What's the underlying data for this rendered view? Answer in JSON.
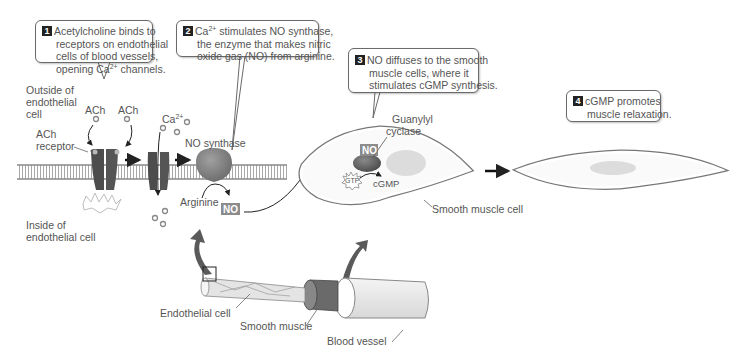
{
  "callouts": [
    {
      "number": "1",
      "lines": [
        "Acetylcholine binds to",
        "receptors on endothelial",
        "cells of blood vessels,",
        "opening Ca2+ channels."
      ]
    },
    {
      "number": "2",
      "lines": [
        "Ca2+ stimulates NO synthase,",
        "the enzyme that makes nitric",
        "oxide gas (NO) from arginine."
      ]
    },
    {
      "number": "3",
      "lines": [
        "NO diffuses to the smooth",
        "muscle cells, where it",
        "stimulates cGMP synthesis."
      ]
    },
    {
      "number": "4",
      "lines": [
        "cGMP promotes",
        "muscle relaxation."
      ]
    }
  ],
  "labels": {
    "outside_cell": [
      "Outside of",
      "endothelial",
      "cell"
    ],
    "inside_cell": [
      "Inside of",
      "endothelial cell"
    ],
    "ach_1": "ACh",
    "ach_2": "ACh",
    "ach_receptor": [
      "ACh",
      "receptor"
    ],
    "ca": "Ca2+",
    "no_synthase": "NO synthase",
    "arginine": "Arginine",
    "no_product": "NO",
    "no_in_muscle": "NO",
    "guanylyl_cyclase": [
      "Guanylyl",
      "cyclase"
    ],
    "gtp": "GTP",
    "cgmp": "cGMP",
    "smooth_muscle_cell": "Smooth muscle cell",
    "endothelial_cell": "Endothelial cell",
    "smooth_muscle": "Smooth muscle",
    "blood_vessel": "Blood vessel"
  },
  "colors": {
    "membrane": "#9a9a9a",
    "protein_dark": "#4d4d4d",
    "enzyme": "#7d7d7d",
    "no_box": "#8c8c8c",
    "cell_fill": "#f7f7f7",
    "nucleus": "#dcdcdc",
    "big_arrow": "#5a5a5a"
  }
}
